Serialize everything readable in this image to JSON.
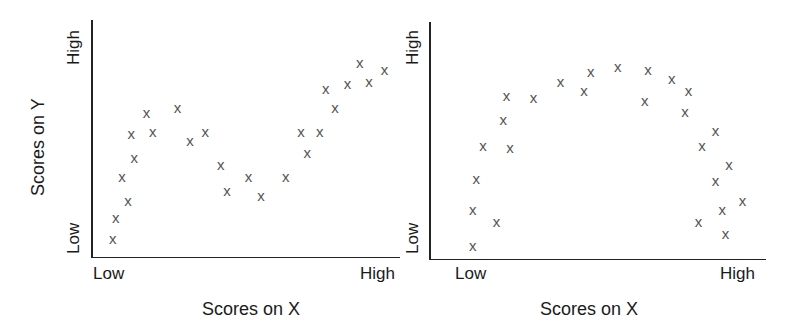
{
  "chart_data": [
    {
      "type": "scatter",
      "title": "",
      "xlabel": "",
      "ylabel": "Scores on Y",
      "x_tick_labels": [
        "Low",
        "High"
      ],
      "y_tick_labels": [
        "Low",
        "High"
      ],
      "xlim": [
        0,
        100
      ],
      "ylim": [
        0,
        100
      ],
      "grid": false,
      "legend": null,
      "marker": "x",
      "shape_description": "S-shaped / cubic (curvilinear) relationship",
      "points": [
        [
          7,
          8
        ],
        [
          8,
          17
        ],
        [
          12,
          24
        ],
        [
          10,
          34
        ],
        [
          14,
          42
        ],
        [
          13,
          52
        ],
        [
          18,
          61
        ],
        [
          20,
          53
        ],
        [
          28,
          63
        ],
        [
          32,
          49
        ],
        [
          37,
          53
        ],
        [
          42,
          39
        ],
        [
          44,
          28
        ],
        [
          51,
          34
        ],
        [
          55,
          26
        ],
        [
          63,
          34
        ],
        [
          68,
          53
        ],
        [
          70,
          44
        ],
        [
          74,
          53
        ],
        [
          79,
          63
        ],
        [
          76,
          71
        ],
        [
          83,
          73
        ],
        [
          90,
          74
        ],
        [
          87,
          82
        ],
        [
          95,
          79
        ]
      ]
    },
    {
      "type": "scatter",
      "title": "",
      "xlabel": "Scores on X",
      "ylabel": "",
      "x_tick_labels": [
        "Low",
        "High"
      ],
      "y_tick_labels": [
        "Low",
        "High"
      ],
      "xlim": [
        0,
        100
      ],
      "ylim": [
        0,
        100
      ],
      "grid": false,
      "legend": null,
      "marker": "x",
      "shape_description": "Inverted-U (curvilinear) relationship",
      "points": [
        [
          13,
          6
        ],
        [
          13,
          21
        ],
        [
          20,
          16
        ],
        [
          14,
          34
        ],
        [
          16,
          48
        ],
        [
          24,
          47
        ],
        [
          22,
          59
        ],
        [
          23,
          69
        ],
        [
          31,
          68
        ],
        [
          39,
          75
        ],
        [
          46,
          71
        ],
        [
          48,
          79
        ],
        [
          56,
          81
        ],
        [
          65,
          80
        ],
        [
          64,
          67
        ],
        [
          72,
          76
        ],
        [
          77,
          71
        ],
        [
          76,
          62
        ],
        [
          85,
          54
        ],
        [
          81,
          48
        ],
        [
          89,
          40
        ],
        [
          85,
          33
        ],
        [
          93,
          25
        ],
        [
          87,
          21
        ],
        [
          80,
          16
        ],
        [
          88,
          11
        ]
      ]
    }
  ],
  "left_panel": {
    "ylabel": "Scores on Y",
    "xlabel": "Scores on X",
    "y_high": "High",
    "y_low": "Low",
    "x_low": "Low",
    "x_high": "High"
  },
  "right_panel": {
    "xlabel": "Scores on X",
    "y_high": "High",
    "y_low": "Low",
    "x_low": "Low",
    "x_high": "High"
  },
  "marker_glyph": "x",
  "colors": {
    "marker": "#555555",
    "axis": "#222222",
    "text": "#1a1a1a"
  }
}
